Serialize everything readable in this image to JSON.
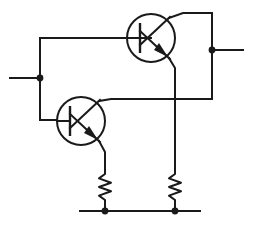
{
  "diagram": {
    "type": "electronic-circuit-schematic",
    "canvas": {
      "width": 253,
      "height": 228
    },
    "style": {
      "background_color": "#ffffff",
      "wire_color": "#1a1a1a",
      "wire_width": 2.0,
      "device_outline_width": 2.0,
      "junction_dot_radius": 3.4
    },
    "components": [
      {
        "id": "Q1",
        "name": "transistor-top",
        "kind": "bjt-npn",
        "label": "",
        "center": {
          "x": 151,
          "y": 38
        },
        "radius": 24,
        "orientation": "base-left-collector-up",
        "terminals": {
          "base": {
            "x": 127,
            "y": 38
          },
          "collector": {
            "x": 169,
            "y": 18
          },
          "emitter": {
            "x": 169,
            "y": 58
          }
        }
      },
      {
        "id": "Q2",
        "name": "transistor-bottom",
        "kind": "bjt-npn",
        "label": "",
        "center": {
          "x": 81,
          "y": 121
        },
        "radius": 24,
        "orientation": "base-left-collector-up",
        "terminals": {
          "base": {
            "x": 57,
            "y": 121
          },
          "collector": {
            "x": 99,
            "y": 101
          },
          "emitter": {
            "x": 99,
            "y": 141
          }
        }
      },
      {
        "id": "R1",
        "name": "resistor-left",
        "kind": "resistor-zigzag",
        "label": "",
        "top": {
          "x": 105,
          "y": 169
        },
        "bottom": {
          "x": 105,
          "y": 205
        },
        "zigzag_peaks": 6,
        "amplitude": 6
      },
      {
        "id": "R2",
        "name": "resistor-right",
        "kind": "resistor-zigzag",
        "label": "",
        "top": {
          "x": 175,
          "y": 169
        },
        "bottom": {
          "x": 175,
          "y": 205
        },
        "zigzag_peaks": 6,
        "amplitude": 6
      }
    ],
    "terminals": [
      {
        "id": "T1",
        "name": "terminal-input-left",
        "label": "",
        "node": {
          "x": 40,
          "y": 78
        },
        "lead_to": {
          "x": 10,
          "y": 78
        },
        "side": "left"
      },
      {
        "id": "T2",
        "name": "terminal-output-right",
        "label": "",
        "node": {
          "x": 212,
          "y": 50
        },
        "lead_to": {
          "x": 243,
          "y": 50
        },
        "side": "right"
      }
    ],
    "ground_rail": {
      "name": "ground-rail",
      "label": "",
      "y": 211,
      "x_start": 80,
      "x_end": 200
    },
    "junction_dots": [
      {
        "name": "junction-input-left",
        "x": 40,
        "y": 78
      },
      {
        "name": "junction-output-right",
        "x": 212,
        "y": 50
      },
      {
        "name": "junction-ground-left",
        "x": 105,
        "y": 211
      },
      {
        "name": "junction-ground-right",
        "x": 175,
        "y": 211
      }
    ],
    "crossings": [
      {
        "name": "wire-crossing-no-connection",
        "x": 175,
        "y": 99
      }
    ],
    "nets": [
      {
        "id": "N1",
        "name": "net-base-bias",
        "label": "",
        "path": "M151,38 L40,38 L40,120 L57,120",
        "description": "left vertical bus joining both transistor bases and the left input terminal"
      },
      {
        "id": "N2",
        "name": "net-q1-collector-to-output",
        "label": "",
        "path": "M169,18 L183,13 L212,13 L212,50",
        "description": "Q1 collector up and across to the right output terminal"
      },
      {
        "id": "N3",
        "name": "net-q1-emitter-to-r2",
        "label": "",
        "path": "M169,58 L175,68 L175,169",
        "description": "Q1 emitter down through crossing to right resistor"
      },
      {
        "id": "N4",
        "name": "net-q2-collector-to-right-bus",
        "label": "",
        "path": "M99,101 L111,99 L212,99",
        "description": "Q2 collector across to the right vertical bus, crossing N3"
      },
      {
        "id": "N5",
        "name": "net-q2-emitter-to-r1",
        "label": "",
        "path": "M99,141 L105,152 L105,169",
        "description": "Q2 emitter down to left resistor"
      },
      {
        "id": "N6",
        "name": "net-right-vertical-bus",
        "label": "",
        "path": "M212,50 L212,99",
        "description": "right vertical wire from output terminal down to Q2 collector line"
      },
      {
        "id": "N7",
        "name": "net-r1-to-ground",
        "label": "",
        "path": "M105,205 L105,211"
      },
      {
        "id": "N8",
        "name": "net-r2-to-ground",
        "label": "",
        "path": "M175,205 L175,211"
      }
    ]
  }
}
